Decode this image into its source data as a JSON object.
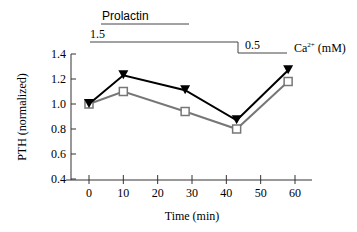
{
  "chart_data": {
    "type": "line",
    "title": "",
    "xlabel": "Time (min)",
    "ylabel": "PTH (normalized)",
    "xlim": [
      0,
      60
    ],
    "ylim": [
      0.4,
      1.4
    ],
    "x_ticks": [
      "0",
      "10",
      "20",
      "30",
      "40",
      "50",
      "60"
    ],
    "y_ticks": [
      "0.4",
      "0.6",
      "0.8",
      "1.0",
      "1.2",
      "1.4"
    ],
    "grid": false,
    "legend": "none",
    "series": [
      {
        "name": "filled-triangle",
        "marker": "filled-triangle-down",
        "color": "#000000",
        "x": [
          0,
          10,
          28,
          43,
          58
        ],
        "values": [
          1.0,
          1.23,
          1.11,
          0.87,
          1.27
        ]
      },
      {
        "name": "open-square",
        "marker": "open-square",
        "color": "#777777",
        "x": [
          0,
          10,
          28,
          43,
          58
        ],
        "values": [
          1.0,
          1.1,
          0.94,
          0.8,
          1.18
        ]
      }
    ],
    "annotations": {
      "prolactin": {
        "label": "Prolactin",
        "start_min": 3.5,
        "end_min": 29
      },
      "calcium": {
        "label_main": "Ca",
        "label_sup": "2+",
        "label_unit": " (mM)",
        "segments": [
          {
            "label": "1.5",
            "start_min": 0,
            "end_min": 43
          },
          {
            "label": "0.5",
            "start_min": 43,
            "end_min": 57
          }
        ]
      }
    }
  }
}
